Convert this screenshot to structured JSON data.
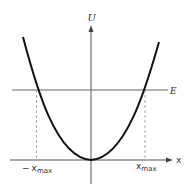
{
  "diagram": {
    "axes": {
      "y_label": "U",
      "x_label": "x"
    },
    "energy_level_label": "E",
    "turning_points": {
      "left_prefix": "−",
      "left_var": "x",
      "left_sub": "max",
      "right_var": "x",
      "right_sub": "max"
    },
    "colors": {
      "curve": "#111111",
      "axes": "#555555",
      "energy_line": "#666666",
      "dashed": "#999999"
    }
  }
}
